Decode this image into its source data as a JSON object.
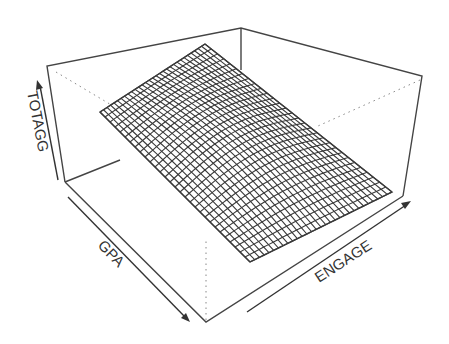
{
  "chart_data": {
    "type": "surface",
    "title": "",
    "xlabel": "GPA",
    "ylabel": "ENGAGE",
    "zlabel": "TOTAGG",
    "grid": false,
    "ticks": false,
    "mesh": {
      "rows": 30,
      "cols": 30
    },
    "colors": {
      "mesh": "#3a3a3a",
      "box": "#444444",
      "background": "#ffffff"
    }
  },
  "axes": {
    "x_label": "GPA",
    "y_label": "ENGAGE",
    "z_label": "TOTAGG"
  }
}
